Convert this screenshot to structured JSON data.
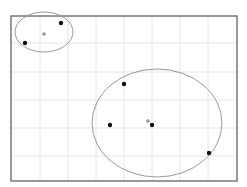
{
  "plot": {
    "frame": {
      "x": 11,
      "y": 16,
      "width": 226,
      "height": 165,
      "stroke": "#555555"
    },
    "grid": {
      "color": "#e6e6e6",
      "vertical_x": [
        40,
        68,
        96,
        124,
        152,
        180,
        208
      ],
      "horizontal_y": [
        43,
        72,
        100,
        128,
        156
      ]
    },
    "clusters": [
      {
        "name": "cluster-1",
        "ellipse": {
          "cx": 44,
          "cy": 32,
          "rx": 29,
          "ry": 20,
          "stroke": "#999999"
        },
        "centroid": {
          "x": 44,
          "y": 34,
          "color": "#999999"
        },
        "points": [
          {
            "x": 61,
            "y": 23
          },
          {
            "x": 25,
            "y": 43
          }
        ]
      },
      {
        "name": "cluster-2",
        "ellipse": {
          "cx": 157,
          "cy": 123,
          "rx": 65,
          "ry": 54,
          "stroke": "#999999"
        },
        "centroid": {
          "x": 148,
          "y": 121,
          "color": "#999999"
        },
        "points": [
          {
            "x": 124,
            "y": 84
          },
          {
            "x": 110,
            "y": 125
          },
          {
            "x": 152,
            "y": 125
          },
          {
            "x": 209,
            "y": 153
          }
        ]
      }
    ],
    "point_color": "#111111",
    "point_radius": 2.2,
    "centroid_radius": 1.8
  }
}
